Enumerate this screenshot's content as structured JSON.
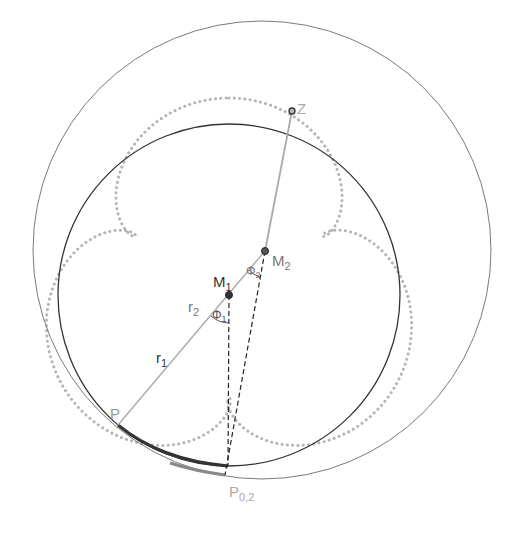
{
  "diagram": {
    "colors": {
      "dark": "#333333",
      "mid": "#777777",
      "light": "#aaaaaa",
      "dots": "#b5b5b5"
    },
    "circles": {
      "inner": {
        "cx": 229,
        "cy": 295,
        "r": 171
      },
      "outer": {
        "cx": 262,
        "cy": 250,
        "r": 229
      }
    },
    "curve": {
      "cx": 229,
      "cy": 290,
      "A": 150,
      "B": 42,
      "k": 4,
      "rotation_deg": -90
    },
    "points": {
      "M1": {
        "x": 229,
        "y": 295
      },
      "M2": {
        "x": 265,
        "y": 251
      },
      "Z": {
        "x": 292,
        "y": 111
      },
      "P": {
        "x": 118,
        "y": 425
      },
      "P02": {
        "x": 225,
        "y": 475
      },
      "C1": {
        "x": 228,
        "y": 466
      }
    },
    "labels": {
      "M1": "M",
      "M1_sub": "1",
      "M2": "M",
      "M2_sub": "2",
      "Z": "Z",
      "P": "P",
      "P02": "P",
      "P02_sub": "0,2",
      "r1": "r",
      "r1_sub": "1",
      "r2": "r",
      "r2_sub": "2",
      "phi1": "Φ",
      "phi1_sub": "1",
      "phi2": "Φ",
      "phi2_sub": "2"
    }
  }
}
